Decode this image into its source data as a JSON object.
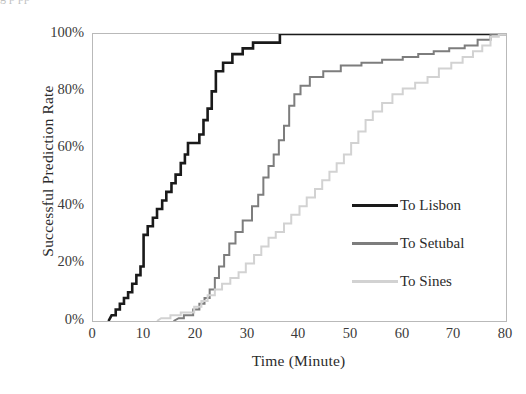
{
  "figure": {
    "top_cut_text": "g                     p              pp",
    "background": "#ffffff"
  },
  "chart_data": {
    "type": "line",
    "subtype": "step-cumulative-distribution",
    "title": "",
    "xlabel": "Time (Minute)",
    "ylabel": "Successful Prediction Rate",
    "xlim": [
      0,
      80
    ],
    "ylim": [
      0,
      1
    ],
    "xticks": [
      0,
      10,
      20,
      30,
      40,
      50,
      60,
      70,
      80
    ],
    "xticklabels": [
      "0",
      "10",
      "20",
      "30",
      "40",
      "50",
      "60",
      "70",
      "80"
    ],
    "yticks": [
      0,
      0.2,
      0.4,
      0.6,
      0.8,
      1.0
    ],
    "yticklabels": [
      "0%",
      "20%",
      "40%",
      "60%",
      "80%",
      "100%"
    ],
    "grid": false,
    "legend_position": "center-right-inside",
    "series": [
      {
        "name": "To Lisbon",
        "color": "#1a1a1a",
        "linewidth": 2.6,
        "points": [
          [
            3.0,
            0.0
          ],
          [
            3.6,
            0.02
          ],
          [
            4.4,
            0.02
          ],
          [
            4.4,
            0.04
          ],
          [
            5.2,
            0.04
          ],
          [
            5.2,
            0.06
          ],
          [
            6.0,
            0.06
          ],
          [
            6.0,
            0.08
          ],
          [
            6.8,
            0.08
          ],
          [
            6.8,
            0.1
          ],
          [
            7.6,
            0.1
          ],
          [
            7.6,
            0.13
          ],
          [
            8.4,
            0.13
          ],
          [
            8.4,
            0.16
          ],
          [
            9.2,
            0.16
          ],
          [
            9.2,
            0.19
          ],
          [
            9.8,
            0.19
          ],
          [
            9.8,
            0.3
          ],
          [
            10.6,
            0.3
          ],
          [
            10.6,
            0.33
          ],
          [
            11.6,
            0.33
          ],
          [
            11.6,
            0.36
          ],
          [
            12.4,
            0.36
          ],
          [
            12.4,
            0.39
          ],
          [
            13.4,
            0.39
          ],
          [
            13.4,
            0.42
          ],
          [
            14.2,
            0.42
          ],
          [
            14.2,
            0.45
          ],
          [
            15.2,
            0.45
          ],
          [
            15.2,
            0.48
          ],
          [
            16.0,
            0.48
          ],
          [
            16.0,
            0.51
          ],
          [
            17.0,
            0.51
          ],
          [
            17.0,
            0.55
          ],
          [
            17.8,
            0.55
          ],
          [
            17.8,
            0.58
          ],
          [
            18.4,
            0.58
          ],
          [
            18.4,
            0.62
          ],
          [
            20.6,
            0.62
          ],
          [
            20.6,
            0.65
          ],
          [
            21.4,
            0.65
          ],
          [
            21.4,
            0.7
          ],
          [
            22.2,
            0.7
          ],
          [
            22.2,
            0.74
          ],
          [
            23.0,
            0.74
          ],
          [
            23.0,
            0.8
          ],
          [
            23.8,
            0.8
          ],
          [
            23.8,
            0.87
          ],
          [
            25.2,
            0.87
          ],
          [
            25.2,
            0.9
          ],
          [
            27.0,
            0.9
          ],
          [
            27.0,
            0.93
          ],
          [
            29.0,
            0.93
          ],
          [
            29.0,
            0.95
          ],
          [
            31.0,
            0.95
          ],
          [
            31.0,
            0.97
          ],
          [
            36.2,
            0.97
          ],
          [
            36.2,
            1.0
          ],
          [
            80.0,
            1.0
          ]
        ]
      },
      {
        "name": "To Setubal",
        "color": "#7d7d7d",
        "linewidth": 2.0,
        "points": [
          [
            15.6,
            0.0
          ],
          [
            16.6,
            0.01
          ],
          [
            17.6,
            0.01
          ],
          [
            17.6,
            0.02
          ],
          [
            19.4,
            0.02
          ],
          [
            19.4,
            0.04
          ],
          [
            20.6,
            0.04
          ],
          [
            20.6,
            0.06
          ],
          [
            21.6,
            0.06
          ],
          [
            21.6,
            0.08
          ],
          [
            22.6,
            0.08
          ],
          [
            22.6,
            0.11
          ],
          [
            23.6,
            0.11
          ],
          [
            23.6,
            0.15
          ],
          [
            24.4,
            0.15
          ],
          [
            24.4,
            0.19
          ],
          [
            25.4,
            0.19
          ],
          [
            25.4,
            0.23
          ],
          [
            26.4,
            0.23
          ],
          [
            26.4,
            0.27
          ],
          [
            27.6,
            0.27
          ],
          [
            27.6,
            0.31
          ],
          [
            29.0,
            0.31
          ],
          [
            29.0,
            0.35
          ],
          [
            30.8,
            0.35
          ],
          [
            30.8,
            0.4
          ],
          [
            32.0,
            0.4
          ],
          [
            32.0,
            0.44
          ],
          [
            33.0,
            0.44
          ],
          [
            33.0,
            0.5
          ],
          [
            34.0,
            0.5
          ],
          [
            34.0,
            0.54
          ],
          [
            35.0,
            0.54
          ],
          [
            35.0,
            0.58
          ],
          [
            36.0,
            0.58
          ],
          [
            36.0,
            0.63
          ],
          [
            37.0,
            0.63
          ],
          [
            37.0,
            0.68
          ],
          [
            38.0,
            0.68
          ],
          [
            38.0,
            0.75
          ],
          [
            39.0,
            0.75
          ],
          [
            39.0,
            0.79
          ],
          [
            40.2,
            0.79
          ],
          [
            40.2,
            0.82
          ],
          [
            42.0,
            0.82
          ],
          [
            42.0,
            0.85
          ],
          [
            44.6,
            0.85
          ],
          [
            44.6,
            0.87
          ],
          [
            48.0,
            0.87
          ],
          [
            48.0,
            0.89
          ],
          [
            52.0,
            0.89
          ],
          [
            52.0,
            0.9
          ],
          [
            56.0,
            0.9
          ],
          [
            56.0,
            0.91
          ],
          [
            60.0,
            0.91
          ],
          [
            60.0,
            0.92
          ],
          [
            63.0,
            0.92
          ],
          [
            63.0,
            0.93
          ],
          [
            66.0,
            0.93
          ],
          [
            66.0,
            0.94
          ],
          [
            69.0,
            0.94
          ],
          [
            69.0,
            0.95
          ],
          [
            72.0,
            0.95
          ],
          [
            72.0,
            0.96
          ],
          [
            74.5,
            0.96
          ],
          [
            74.5,
            0.98
          ],
          [
            77.0,
            0.98
          ],
          [
            77.0,
            1.0
          ],
          [
            80.0,
            1.0
          ]
        ]
      },
      {
        "name": "To Sines",
        "color": "#d2d2d2",
        "linewidth": 2.0,
        "points": [
          [
            12.4,
            0.0
          ],
          [
            13.2,
            0.01
          ],
          [
            15.0,
            0.01
          ],
          [
            15.0,
            0.02
          ],
          [
            17.0,
            0.02
          ],
          [
            17.0,
            0.03
          ],
          [
            19.6,
            0.03
          ],
          [
            19.6,
            0.05
          ],
          [
            21.0,
            0.05
          ],
          [
            21.0,
            0.07
          ],
          [
            22.2,
            0.07
          ],
          [
            22.2,
            0.09
          ],
          [
            23.6,
            0.09
          ],
          [
            23.6,
            0.11
          ],
          [
            25.0,
            0.11
          ],
          [
            25.0,
            0.13
          ],
          [
            26.6,
            0.13
          ],
          [
            26.6,
            0.15
          ],
          [
            28.2,
            0.15
          ],
          [
            28.2,
            0.17
          ],
          [
            29.6,
            0.17
          ],
          [
            29.6,
            0.2
          ],
          [
            31.2,
            0.2
          ],
          [
            31.2,
            0.23
          ],
          [
            32.6,
            0.23
          ],
          [
            32.6,
            0.26
          ],
          [
            34.0,
            0.26
          ],
          [
            34.0,
            0.29
          ],
          [
            35.4,
            0.29
          ],
          [
            35.4,
            0.31
          ],
          [
            37.0,
            0.31
          ],
          [
            37.0,
            0.34
          ],
          [
            38.4,
            0.34
          ],
          [
            38.4,
            0.37
          ],
          [
            40.0,
            0.37
          ],
          [
            40.0,
            0.4
          ],
          [
            41.4,
            0.4
          ],
          [
            41.4,
            0.43
          ],
          [
            43.0,
            0.43
          ],
          [
            43.0,
            0.46
          ],
          [
            44.4,
            0.46
          ],
          [
            44.4,
            0.49
          ],
          [
            45.8,
            0.49
          ],
          [
            45.8,
            0.52
          ],
          [
            47.2,
            0.52
          ],
          [
            47.2,
            0.55
          ],
          [
            48.6,
            0.55
          ],
          [
            48.6,
            0.58
          ],
          [
            50.0,
            0.58
          ],
          [
            50.0,
            0.62
          ],
          [
            51.4,
            0.62
          ],
          [
            51.4,
            0.66
          ],
          [
            52.8,
            0.66
          ],
          [
            52.8,
            0.7
          ],
          [
            54.2,
            0.7
          ],
          [
            54.2,
            0.73
          ],
          [
            56.0,
            0.73
          ],
          [
            56.0,
            0.76
          ],
          [
            58.0,
            0.76
          ],
          [
            58.0,
            0.79
          ],
          [
            60.0,
            0.79
          ],
          [
            60.0,
            0.81
          ],
          [
            62.4,
            0.81
          ],
          [
            62.4,
            0.83
          ],
          [
            64.8,
            0.83
          ],
          [
            64.8,
            0.85
          ],
          [
            67.0,
            0.85
          ],
          [
            67.0,
            0.88
          ],
          [
            69.4,
            0.88
          ],
          [
            69.4,
            0.9
          ],
          [
            71.6,
            0.9
          ],
          [
            71.6,
            0.92
          ],
          [
            73.6,
            0.92
          ],
          [
            73.6,
            0.94
          ],
          [
            75.4,
            0.94
          ],
          [
            75.4,
            0.96
          ],
          [
            77.0,
            0.96
          ],
          [
            77.0,
            0.99
          ],
          [
            78.6,
            0.99
          ],
          [
            78.6,
            1.0
          ],
          [
            80.0,
            1.0
          ]
        ]
      }
    ]
  },
  "legend": {
    "items": [
      {
        "label": "To Lisbon",
        "color": "#1a1a1a",
        "thickness": "3px"
      },
      {
        "label": "To Setubal",
        "color": "#7d7d7d",
        "thickness": "3px"
      },
      {
        "label": "To Sines",
        "color": "#d2d2d2",
        "thickness": "3px"
      }
    ]
  }
}
